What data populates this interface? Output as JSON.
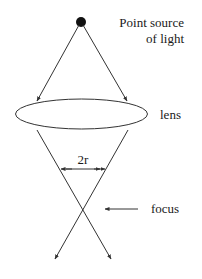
{
  "diagram": {
    "labels": {
      "source_line1": "Point source",
      "source_line2": "of light",
      "lens": "lens",
      "aperture": "2r",
      "focus": "focus"
    },
    "colors": {
      "stroke": "#333333",
      "text": "#1a1a1a",
      "background": "#ffffff"
    }
  }
}
